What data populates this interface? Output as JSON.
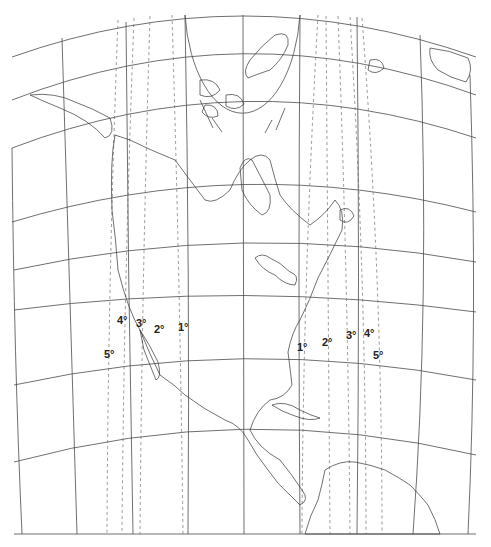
{
  "map": {
    "title": "Conic projection of North America with lines of equal maximum angular distortion",
    "colors": {
      "graticule": "#4a4a4a",
      "isolines": "#6a6a6a",
      "coastline": "#333333",
      "background": "#ffffff"
    },
    "isoline_labels_west": [
      {
        "text": "4°",
        "x": 117,
        "y": 315
      },
      {
        "text": "3°",
        "x": 136,
        "y": 318
      },
      {
        "text": "2°",
        "x": 154,
        "y": 324
      },
      {
        "text": "1°",
        "x": 178,
        "y": 322
      },
      {
        "text": "5°",
        "x": 104,
        "y": 349
      }
    ],
    "isoline_labels_east": [
      {
        "text": "1°",
        "x": 297,
        "y": 342
      },
      {
        "text": "2°",
        "x": 322,
        "y": 337
      },
      {
        "text": "3°",
        "x": 346,
        "y": 330
      },
      {
        "text": "4°",
        "x": 364,
        "y": 328
      },
      {
        "text": "5°",
        "x": 373,
        "y": 350
      }
    ]
  }
}
